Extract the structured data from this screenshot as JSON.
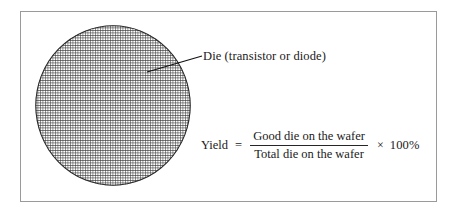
{
  "figure": {
    "caption_label": "Die (transistor or diode)",
    "border_color": "#9a9a9a",
    "background_color": "#ffffff"
  },
  "wafer": {
    "name": "silicon-wafer",
    "shape": "circle",
    "grid_fill": "die-grid-crosshatch",
    "grid_line_color": "#3a3a3a",
    "grid_cell_size_px": 2.5,
    "diameter_px": 158
  },
  "annotation": {
    "leader_line": "pointer-line",
    "label": "Die (transistor or diode)"
  },
  "equation": {
    "left_term": "Yield",
    "equals": "=",
    "numerator": "Good die on the wafer",
    "denominator": "Total die on the wafer",
    "times": "×",
    "multiplier": "100%"
  }
}
